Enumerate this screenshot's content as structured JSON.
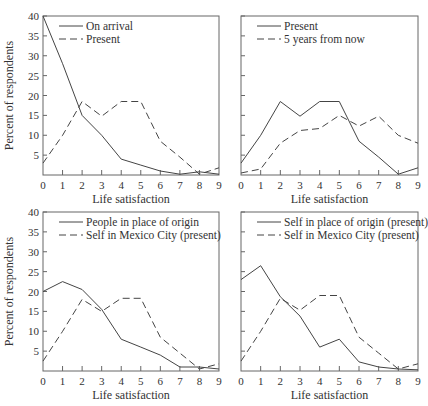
{
  "chart_data": [
    {
      "type": "line",
      "panel": "top-left",
      "title": "",
      "xlabel": "Life satisfaction",
      "ylabel": "Percent of respondents",
      "x": [
        0,
        1,
        2,
        3,
        4,
        5,
        6,
        7,
        8,
        9
      ],
      "ylim": [
        0,
        40
      ],
      "yticks": [
        5,
        10,
        15,
        20,
        25,
        30,
        35,
        40
      ],
      "show_ytick_labels": true,
      "grid": false,
      "legend_position": "upper-left",
      "series": [
        {
          "name": "On arrival",
          "style": "solid",
          "values": [
            40,
            28,
            15,
            10,
            4,
            2.5,
            1,
            0.2,
            0.8,
            0.2
          ]
        },
        {
          "name": "Present",
          "style": "dashed",
          "values": [
            3,
            10,
            18.5,
            14.8,
            18.5,
            18.5,
            8.5,
            4.5,
            0.2,
            1.8
          ]
        }
      ]
    },
    {
      "type": "line",
      "panel": "top-right",
      "title": "",
      "xlabel": "Life satisfaction",
      "ylabel": "",
      "x": [
        0,
        1,
        2,
        3,
        4,
        5,
        6,
        7,
        8,
        9
      ],
      "ylim": [
        0,
        40
      ],
      "yticks": [
        5,
        10,
        15,
        20,
        25,
        30,
        35,
        40
      ],
      "show_ytick_labels": false,
      "grid": false,
      "legend_position": "upper-left",
      "series": [
        {
          "name": "Present",
          "style": "solid",
          "values": [
            3,
            10,
            18.5,
            14.8,
            18.5,
            18.5,
            8.5,
            4.5,
            0.2,
            1.8
          ]
        },
        {
          "name": "5 years from now",
          "style": "dashed",
          "values": [
            0.5,
            1.5,
            8,
            11.2,
            11.7,
            15,
            12.3,
            14.8,
            10,
            8
          ]
        }
      ]
    },
    {
      "type": "line",
      "panel": "bottom-left",
      "title": "",
      "xlabel": "Life satisfaction",
      "ylabel": "Percent of respondents",
      "x": [
        0,
        1,
        2,
        3,
        4,
        5,
        6,
        7,
        8,
        9
      ],
      "ylim": [
        0,
        40
      ],
      "yticks": [
        5,
        10,
        15,
        20,
        25,
        30,
        35,
        40
      ],
      "show_ytick_labels": true,
      "grid": false,
      "legend_position": "upper-left",
      "series": [
        {
          "name": "People in place of origin",
          "style": "solid",
          "values": [
            20,
            22.5,
            20.5,
            15.5,
            8,
            6,
            4,
            1,
            1,
            0.5
          ]
        },
        {
          "name": "Self in Mexico City (present)",
          "style": "dashed",
          "values": [
            2.5,
            10,
            18,
            15,
            18.3,
            18.3,
            8.5,
            4.5,
            0.5,
            1.8
          ]
        }
      ]
    },
    {
      "type": "line",
      "panel": "bottom-right",
      "title": "",
      "xlabel": "Life satisfaction",
      "ylabel": "",
      "x": [
        0,
        1,
        2,
        3,
        4,
        5,
        6,
        7,
        8,
        9
      ],
      "ylim": [
        0,
        40
      ],
      "yticks": [
        5,
        10,
        15,
        20,
        25,
        30,
        35,
        40
      ],
      "show_ytick_labels": false,
      "grid": false,
      "legend_position": "upper-left",
      "series": [
        {
          "name": "Self in place of origin (present)",
          "style": "solid",
          "values": [
            23,
            26.5,
            18.7,
            13.8,
            6,
            8,
            2.3,
            1,
            0.5,
            0.3
          ]
        },
        {
          "name": "Self in Mexico City (present)",
          "style": "dashed",
          "values": [
            2.5,
            10,
            18.3,
            15.3,
            19,
            19,
            8.5,
            4.5,
            0.5,
            1.8
          ]
        }
      ]
    }
  ],
  "labels": {
    "xlabel": "Life satisfaction",
    "ylabel": "Percent of respondents",
    "xticks": [
      "0",
      "1",
      "2",
      "3",
      "4",
      "5",
      "6",
      "7",
      "8",
      "9"
    ],
    "yticks": [
      "5",
      "10",
      "15",
      "20",
      "25",
      "30",
      "35",
      "40"
    ]
  }
}
